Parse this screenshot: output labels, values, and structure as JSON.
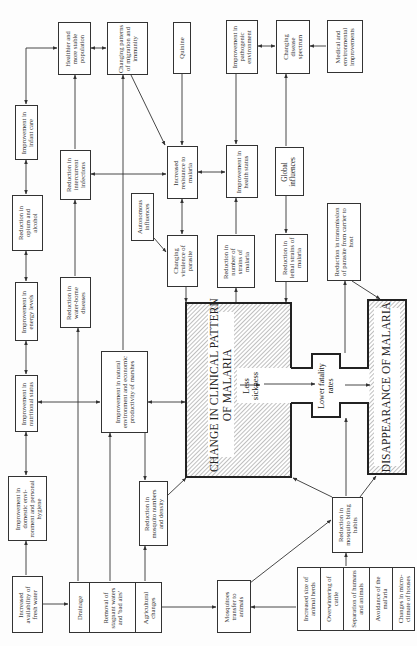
{
  "diagram": {
    "title_boxes": {
      "clinical": "CHANGE IN CLINICAL PATTERN OF MALARIA",
      "clinical_l1": "CHANGE IN CLINICAL PATTERN",
      "clinical_l2": "OF MALARIA",
      "disappearance": "DISAPPEARANCE OF MALARIA",
      "less_sickness": "Less sickness",
      "lower_fatality": "Lower fatality rates"
    },
    "nodes": {
      "healthier_population": "Healthier and more stable population",
      "migration_immunity": "Changing patterns of migration and immunity",
      "quinine": "Quinine",
      "pathogenic_environment": "Improvement in pathogenic environment",
      "disease_spectrum": "Changing disease spectrum",
      "medical_environmental": "Medical and environmental improvements",
      "infant_care": "Improvement in infant care",
      "intercurrent_infections": "Reduction in intercurrent infections",
      "increased_resistance": "Increased resistance to malaria",
      "health_status": "Improvement in health status",
      "global_influences": "Global influences",
      "opium_alcohol": "Reduction in opium and alcohol",
      "autonomous_influences": "Autonomous influences",
      "virulence_parasite": "Changing virulence of parasite",
      "number_of_strains": "Reduction in number of strains of malaria",
      "lethal_strains": "Reduction in lethal strains of malaria",
      "transmission_parasite": "Reduction in transmission of parasite from carrier to host",
      "energy_levels": "Improvement in energy levels",
      "water_borne": "Reduction in water-borne diseases",
      "nutritional_status": "Improvement in nutritional status",
      "natural_environment": "Improvement in natural environment and economic productivity of marshes",
      "domestic_environment": "Improvement in domestic envi-ronment and personal hygiene",
      "mosquito_numbers": "Reduction in mosquito numbers and density",
      "fresh_water": "Increased availability of fresh water",
      "mosquitoes_animals": "Mosquitoes transfer to animals",
      "mosquito_biting": "Reduction in mosquito biting habits"
    },
    "drainage_group": [
      "Drainage",
      "Removal of stagnant waters and 'bad airs'",
      "Agricultural changes"
    ],
    "animal_group": [
      "Increased size of animal herds",
      "Overwintering of cattle",
      "Separation of humans and animals",
      "Avoidance of the mal'aria",
      "Changes in micro-climate of houses"
    ],
    "colors": {
      "line": "#333333",
      "hatch": "#8a8a8a",
      "background": "#fdfdfd"
    }
  }
}
